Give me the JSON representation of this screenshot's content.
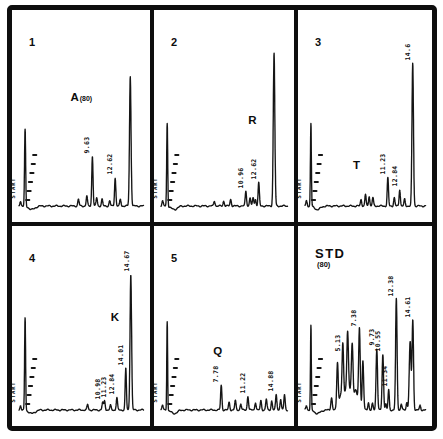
{
  "figure": {
    "ink_color": "#151515",
    "paper_color": "#ffffff",
    "start_label": "START"
  },
  "chart_data": [
    {
      "type": "line",
      "panel_label": "1",
      "annotation": {
        "text": "A",
        "suffix": "(80)",
        "rt": 7.4,
        "height": 0.62
      },
      "peaks": [
        {
          "rt": 0.2,
          "height": 0.03
        },
        {
          "rt": 0.8,
          "height": 0.46,
          "width": 0.07,
          "role": "solvent-front"
        },
        {
          "rt": 7.8,
          "height": 0.04
        },
        {
          "rt": 8.9,
          "height": 0.06
        },
        {
          "rt": 9.63,
          "height": 0.3,
          "label": "9.63"
        },
        {
          "rt": 10.2,
          "height": 0.05
        },
        {
          "rt": 10.9,
          "height": 0.04
        },
        {
          "rt": 11.9,
          "height": 0.03
        },
        {
          "rt": 12.62,
          "height": 0.17,
          "label": "12.62"
        },
        {
          "rt": 13.3,
          "height": 0.04
        },
        {
          "rt": 14.6,
          "height": 0.78,
          "width": 0.1
        }
      ]
    },
    {
      "type": "line",
      "panel_label": "2",
      "annotation": {
        "text": "R",
        "rt": 11.9,
        "height": 0.48
      },
      "peaks": [
        {
          "rt": 0.2,
          "height": 0.03
        },
        {
          "rt": 0.8,
          "height": 0.5,
          "width": 0.065,
          "role": "solvent-front"
        },
        {
          "rt": 6.9,
          "height": 0.03
        },
        {
          "rt": 8.1,
          "height": 0.03
        },
        {
          "rt": 9.0,
          "height": 0.04
        },
        {
          "rt": 10.96,
          "height": 0.09,
          "label": "10.96"
        },
        {
          "rt": 11.5,
          "height": 0.05
        },
        {
          "rt": 11.9,
          "height": 0.05
        },
        {
          "rt": 12.2,
          "height": 0.04
        },
        {
          "rt": 12.62,
          "height": 0.14,
          "label": "12.62"
        },
        {
          "rt": 14.6,
          "height": 0.92,
          "width": 0.1
        }
      ]
    },
    {
      "type": "line",
      "panel_label": "3",
      "annotation": {
        "text": "T",
        "rt": 7.2,
        "height": 0.21
      },
      "peaks": [
        {
          "rt": 0.2,
          "height": 0.03
        },
        {
          "rt": 0.8,
          "height": 0.5,
          "width": 0.065,
          "role": "solvent-front"
        },
        {
          "rt": 7.6,
          "height": 0.04
        },
        {
          "rt": 8.2,
          "height": 0.07
        },
        {
          "rt": 8.7,
          "height": 0.06
        },
        {
          "rt": 9.2,
          "height": 0.05
        },
        {
          "rt": 11.23,
          "height": 0.17,
          "label": "11.23"
        },
        {
          "rt": 12.1,
          "height": 0.05
        },
        {
          "rt": 12.84,
          "height": 0.1,
          "label": "12.84"
        },
        {
          "rt": 13.5,
          "height": 0.04
        },
        {
          "rt": 14.6,
          "height": 0.86,
          "width": 0.1,
          "label": "14.6"
        }
      ]
    },
    {
      "type": "line",
      "panel_label": "4",
      "annotation": {
        "text": "K",
        "rt": 12.7,
        "height": 0.56
      },
      "peaks": [
        {
          "rt": 0.2,
          "height": 0.03
        },
        {
          "rt": 0.8,
          "height": 0.6,
          "width": 0.065,
          "role": "solvent-front"
        },
        {
          "rt": 9.0,
          "height": 0.035
        },
        {
          "rt": 10.98,
          "height": 0.05,
          "label": "10.98"
        },
        {
          "rt": 11.23,
          "height": 0.06,
          "label": "11.23"
        },
        {
          "rt": 12.0,
          "height": 0.03
        },
        {
          "rt": 12.84,
          "height": 0.08,
          "label": "12.84"
        },
        {
          "rt": 14.01,
          "height": 0.27,
          "width": 0.08,
          "label": "14.01"
        },
        {
          "rt": 14.67,
          "height": 0.88,
          "width": 0.1,
          "label": "14.67"
        }
      ]
    },
    {
      "type": "line",
      "panel_label": "5",
      "annotation": {
        "text": "Q",
        "rt": 7.4,
        "height": 0.34
      },
      "peaks": [
        {
          "rt": 0.2,
          "height": 0.03
        },
        {
          "rt": 0.8,
          "height": 0.58,
          "width": 0.055,
          "role": "solvent-front"
        },
        {
          "rt": 7.78,
          "height": 0.16,
          "label": "7.78"
        },
        {
          "rt": 8.8,
          "height": 0.05
        },
        {
          "rt": 9.6,
          "height": 0.06
        },
        {
          "rt": 10.3,
          "height": 0.04
        },
        {
          "rt": 11.22,
          "height": 0.09,
          "label": "11.22"
        },
        {
          "rt": 12.2,
          "height": 0.05
        },
        {
          "rt": 12.9,
          "height": 0.06
        },
        {
          "rt": 13.6,
          "height": 0.07
        },
        {
          "rt": 14.3,
          "height": 0.06
        },
        {
          "rt": 14.88,
          "height": 0.1,
          "label": "14.88"
        },
        {
          "rt": 15.45,
          "height": 0.07
        },
        {
          "rt": 15.95,
          "height": 0.1
        }
      ]
    },
    {
      "type": "line",
      "panel_label": "STD",
      "panel_sublabel": "(80)",
      "peaks": [
        {
          "rt": 0.2,
          "height": 0.03
        },
        {
          "rt": 0.8,
          "height": 0.55,
          "width": 0.06,
          "role": "solvent-front"
        },
        {
          "rt": 3.6,
          "height": 0.08,
          "width": 0.1
        },
        {
          "rt": 4.4,
          "height": 0.3,
          "width": 0.1
        },
        {
          "rt": 4.85,
          "height": 0.1,
          "width": 0.22
        },
        {
          "rt": 5.13,
          "height": 0.36,
          "width": 0.1,
          "label": "5.13"
        },
        {
          "rt": 5.5,
          "height": 0.12,
          "width": 0.22
        },
        {
          "rt": 5.78,
          "height": 0.42,
          "width": 0.11
        },
        {
          "rt": 6.1,
          "height": 0.12,
          "width": 0.22
        },
        {
          "rt": 6.4,
          "height": 0.36,
          "width": 0.11
        },
        {
          "rt": 6.85,
          "height": 0.13,
          "width": 0.25
        },
        {
          "rt": 7.38,
          "height": 0.52,
          "width": 0.11,
          "label": "7.38"
        },
        {
          "rt": 7.85,
          "height": 0.32,
          "width": 0.1
        },
        {
          "rt": 8.6,
          "height": 0.05
        },
        {
          "rt": 9.15,
          "height": 0.04
        },
        {
          "rt": 9.73,
          "height": 0.4,
          "width": 0.1,
          "label": "9.73"
        },
        {
          "rt": 10.55,
          "height": 0.36,
          "width": 0.1,
          "label": "10.55"
        },
        {
          "rt": 10.95,
          "height": 0.04
        },
        {
          "rt": 11.34,
          "height": 0.13,
          "label": "11.34"
        },
        {
          "rt": 12.38,
          "height": 0.72,
          "width": 0.1,
          "label": "12.38"
        },
        {
          "rt": 13.05,
          "height": 0.04
        },
        {
          "rt": 13.8,
          "height": 0.05
        },
        {
          "rt": 14.25,
          "height": 0.44,
          "width": 0.12
        },
        {
          "rt": 14.61,
          "height": 0.58,
          "width": 0.1,
          "label": "14.61"
        },
        {
          "rt": 15.6,
          "height": 0.03
        }
      ]
    }
  ]
}
